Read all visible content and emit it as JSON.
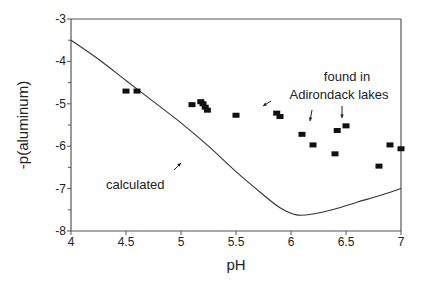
{
  "chart_data": {
    "type": "scatter",
    "title": "",
    "xlabel": "pH",
    "ylabel": "-p(aluminum)",
    "xlim": [
      4,
      7
    ],
    "ylim": [
      -8,
      -3
    ],
    "grid": false,
    "legend": null,
    "x_ticks": [
      "4",
      "4.5",
      "5",
      "5.5",
      "6",
      "6.5",
      "7"
    ],
    "y_ticks": [
      "-3",
      "-4",
      "-5",
      "-6",
      "-7",
      "-8"
    ],
    "series": [
      {
        "name": "calculated",
        "kind": "line",
        "points": [
          [
            4.0,
            -3.5
          ],
          [
            4.25,
            -3.95
          ],
          [
            4.5,
            -4.45
          ],
          [
            4.75,
            -4.95
          ],
          [
            5.0,
            -5.45
          ],
          [
            5.25,
            -6.0
          ],
          [
            5.5,
            -6.6
          ],
          [
            5.75,
            -7.15
          ],
          [
            5.9,
            -7.45
          ],
          [
            6.05,
            -7.62
          ],
          [
            6.2,
            -7.6
          ],
          [
            6.4,
            -7.48
          ],
          [
            6.6,
            -7.32
          ],
          [
            6.8,
            -7.17
          ],
          [
            7.0,
            -7.0
          ]
        ]
      },
      {
        "name": "found in Adirondack lakes",
        "kind": "scatter",
        "points": [
          [
            4.5,
            -4.7
          ],
          [
            4.6,
            -4.7
          ],
          [
            5.1,
            -5.02
          ],
          [
            5.18,
            -4.95
          ],
          [
            5.2,
            -5.0
          ],
          [
            5.22,
            -5.08
          ],
          [
            5.24,
            -5.15
          ],
          [
            5.5,
            -5.27
          ],
          [
            5.87,
            -5.22
          ],
          [
            5.9,
            -5.3
          ],
          [
            6.1,
            -5.72
          ],
          [
            6.2,
            -5.97
          ],
          [
            6.4,
            -6.18
          ],
          [
            6.42,
            -5.63
          ],
          [
            6.5,
            -5.52
          ],
          [
            6.8,
            -6.47
          ],
          [
            6.9,
            -5.97
          ],
          [
            7.0,
            -6.06
          ]
        ]
      }
    ],
    "annotations": [
      {
        "text": "calculated",
        "at": [
          4.6,
          -6.8
        ],
        "arrow_to": [
          4.8,
          -6.4
        ]
      },
      {
        "text_lines": [
          "found in",
          "Adirondack lakes"
        ],
        "at": [
          6.45,
          -4.3
        ],
        "arrows_to": [
          [
            5.63,
            -5.1
          ],
          [
            6.2,
            -5.8
          ],
          [
            6.5,
            -5.45
          ]
        ]
      }
    ]
  },
  "labels": {
    "xlabel": "pH",
    "ylabel": "-p(aluminum)",
    "calculated": "calculated",
    "found_line1": "found in",
    "found_line2": "Adirondack lakes"
  }
}
